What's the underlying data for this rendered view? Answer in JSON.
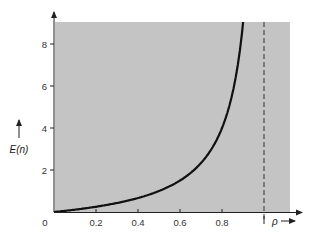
{
  "chart_data": {
    "type": "line",
    "title": "",
    "xlabel": "ρ",
    "ylabel": "E(n)",
    "xlim": [
      0,
      1.13
    ],
    "ylim": [
      0,
      9.2
    ],
    "grid": false,
    "legend": null,
    "x_ticks": [
      0,
      0.2,
      0.4,
      0.6,
      0.8
    ],
    "x_tick_labels": [
      "0",
      "0.2",
      "0.4",
      "0.6",
      "0.8"
    ],
    "y_ticks": [
      2,
      4,
      6,
      8
    ],
    "y_tick_labels": [
      "2",
      "4",
      "6",
      "8"
    ],
    "background": "#c4c4c4",
    "series": [
      {
        "name": "E(n)",
        "color": "#111111",
        "x": [
          0,
          0.1,
          0.2,
          0.3,
          0.4,
          0.5,
          0.6,
          0.7,
          0.75,
          0.8,
          0.85,
          0.9,
          0.92
        ],
        "y": [
          0,
          0.11,
          0.25,
          0.43,
          0.67,
          1.0,
          1.5,
          2.33,
          3.0,
          4.0,
          5.67,
          9.0,
          11.5
        ]
      }
    ],
    "annotations": [
      {
        "type": "vertical-dashed-line",
        "x": 1.0,
        "label": "ρ = 1 asymptote"
      }
    ]
  },
  "labels": {
    "origin": "0",
    "x_axis": "ρ",
    "y_axis": "E(n)"
  }
}
